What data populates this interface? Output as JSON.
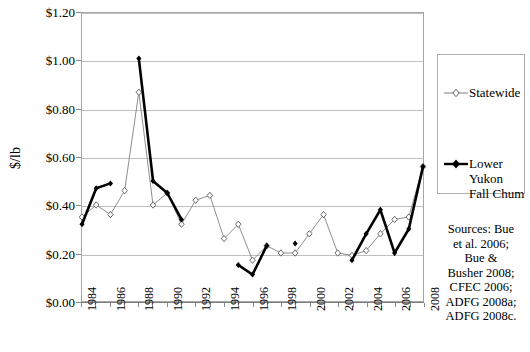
{
  "chart_data": {
    "type": "line",
    "title": "",
    "xlabel": "",
    "ylabel": "$/lb",
    "ylim": [
      0.0,
      1.2
    ],
    "xlim": [
      1984,
      2008
    ],
    "grid": true,
    "legend_position": "right",
    "y_ticks": [
      "$0.00",
      "$0.20",
      "$0.40",
      "$0.60",
      "$0.80",
      "$1.00",
      "$1.20"
    ],
    "y_tick_values": [
      0.0,
      0.2,
      0.4,
      0.6,
      0.8,
      1.0,
      1.2
    ],
    "x": [
      1984,
      1985,
      1986,
      1987,
      1988,
      1989,
      1990,
      1991,
      1992,
      1993,
      1994,
      1995,
      1996,
      1997,
      1998,
      1999,
      2000,
      2001,
      2002,
      2003,
      2004,
      2005,
      2006,
      2007,
      2008
    ],
    "x_tick_labels": [
      "1984",
      "1986",
      "1988",
      "1990",
      "1992",
      "1994",
      "1996",
      "1998",
      "2000",
      "2002",
      "2004",
      "2006",
      "2008"
    ],
    "x_tick_values": [
      1984,
      1986,
      1988,
      1990,
      1992,
      1994,
      1996,
      1998,
      2000,
      2002,
      2004,
      2006,
      2008
    ],
    "series": [
      {
        "name": "Statewide",
        "marker": "open-diamond",
        "color": "#808080",
        "values": [
          0.35,
          0.4,
          0.36,
          0.46,
          0.87,
          0.4,
          0.45,
          0.32,
          0.42,
          0.44,
          0.26,
          0.32,
          0.17,
          0.23,
          0.2,
          0.2,
          0.28,
          0.36,
          0.2,
          0.19,
          0.21,
          0.28,
          0.34,
          0.35,
          0.56
        ]
      },
      {
        "name": "Lower Yukon Fall Chum",
        "marker": "filled-diamond",
        "color": "#000000",
        "values": [
          0.32,
          0.47,
          0.49,
          null,
          1.01,
          0.5,
          0.45,
          0.34,
          null,
          null,
          null,
          0.15,
          0.11,
          0.23,
          null,
          0.24,
          null,
          null,
          null,
          0.17,
          0.28,
          0.38,
          0.2,
          0.3,
          0.56
        ]
      }
    ]
  },
  "legend": {
    "entries": [
      {
        "label": "Statewide",
        "marker": "open-diamond"
      },
      {
        "label": "Lower Yukon Fall Chum",
        "marker": "filled-diamond"
      }
    ]
  },
  "sources": {
    "lines": [
      "Sources:  Bue",
      "et al. 2006;",
      "Bue &",
      "Busher 2008;",
      "CFEC 2006;",
      "ADFG 2008a;",
      "ADFG 2008c."
    ]
  }
}
